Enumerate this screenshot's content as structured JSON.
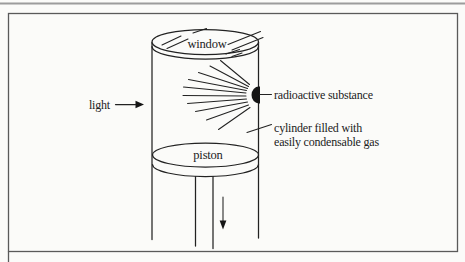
{
  "figure": {
    "type": "physics-diagram",
    "labels": {
      "window": "window",
      "light": "light",
      "radioactive_substance": "radioactive substance",
      "cylinder_fill_line1": "cylinder filled with",
      "cylinder_fill_line2": "easily condensable gas",
      "piston": "piston"
    },
    "icons": {
      "light_arrow": "right-arrow-icon",
      "piston_arrow": "down-arrow-icon"
    },
    "colors": {
      "ink": "#222222",
      "paper": "#fbfbf9",
      "frame": "#5a5a5a",
      "page_edge": "#9c9c9c",
      "substance_fill": "#151515"
    }
  }
}
